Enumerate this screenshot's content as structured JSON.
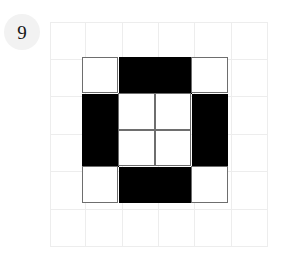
{
  "item": {
    "index_label": "9"
  },
  "figure": {
    "background_grid": {
      "columns": 6,
      "rows": 6,
      "line_color": "#ededed"
    },
    "pattern_grid": {
      "columns": 4,
      "rows": 4,
      "fill_color": "#000000",
      "empty_color": "#ffffff",
      "outline_color": "#6e6e6e",
      "cells": [
        [
          0,
          1,
          1,
          0
        ],
        [
          1,
          0,
          0,
          1
        ],
        [
          1,
          0,
          0,
          1
        ],
        [
          0,
          1,
          1,
          0
        ]
      ]
    }
  },
  "colors": {
    "badge_background": "#f2f2f2",
    "badge_text": "#161616",
    "page_background": "#ffffff"
  }
}
